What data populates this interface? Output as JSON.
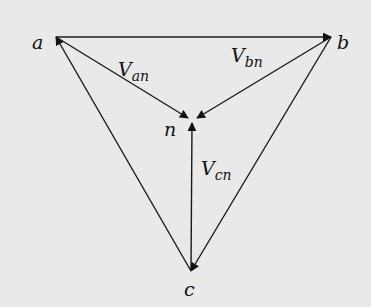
{
  "diagram": {
    "nodes": [
      {
        "id": "a",
        "label": "a"
      },
      {
        "id": "b",
        "label": "b"
      },
      {
        "id": "n",
        "label": "n"
      },
      {
        "id": "c",
        "label": "c"
      }
    ],
    "edges": [
      {
        "id": "ab",
        "from": "a",
        "to": "b",
        "label": ""
      },
      {
        "id": "bc",
        "from": "b",
        "to": "c",
        "label": ""
      },
      {
        "id": "ca",
        "from": "c",
        "to": "a",
        "label": ""
      },
      {
        "id": "an",
        "from": "a",
        "to": "n",
        "label_main": "V",
        "label_sub": "an"
      },
      {
        "id": "bn",
        "from": "b",
        "to": "n",
        "label_main": "V",
        "label_sub": "bn"
      },
      {
        "id": "cn",
        "from": "c",
        "to": "n",
        "label_main": "V",
        "label_sub": "cn"
      }
    ],
    "colors": {
      "background": "#e9e9e9",
      "ink": "#1a1a1a"
    }
  }
}
